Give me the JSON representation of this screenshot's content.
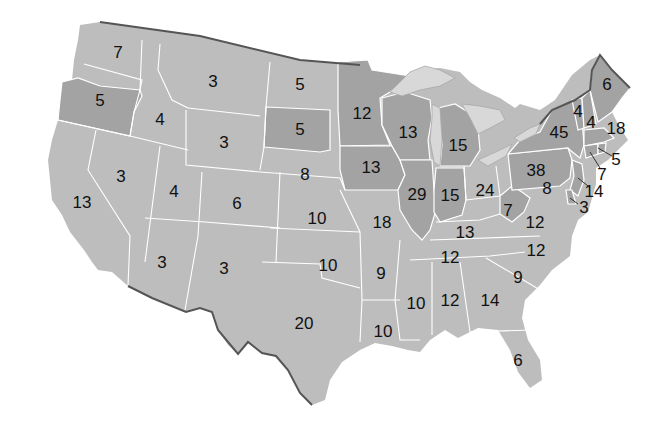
{
  "map": {
    "title": "",
    "type": "choropleth-electoral-votes",
    "colors": {
      "light": "#bdbdbd",
      "dark": "#a3a3a3",
      "border": "#555555",
      "background": "#ffffff"
    },
    "states": [
      {
        "abbr": "WA",
        "value": "7",
        "x": 118,
        "y": 52,
        "shade": "light"
      },
      {
        "abbr": "OR",
        "value": "5",
        "x": 100,
        "y": 100,
        "shade": "dark"
      },
      {
        "abbr": "CA",
        "value": "13",
        "x": 82,
        "y": 202,
        "shade": "light"
      },
      {
        "abbr": "NV",
        "value": "3",
        "x": 121,
        "y": 176,
        "shade": "light"
      },
      {
        "abbr": "ID",
        "value": "4",
        "x": 160,
        "y": 119,
        "shade": "light"
      },
      {
        "abbr": "MT",
        "value": "3",
        "x": 213,
        "y": 81,
        "shade": "light"
      },
      {
        "abbr": "WY",
        "value": "3",
        "x": 224,
        "y": 142,
        "shade": "light"
      },
      {
        "abbr": "UT",
        "value": "4",
        "x": 174,
        "y": 191,
        "shade": "light"
      },
      {
        "abbr": "AZ",
        "value": "3",
        "x": 162,
        "y": 262,
        "shade": "light"
      },
      {
        "abbr": "CO",
        "value": "6",
        "x": 237,
        "y": 203,
        "shade": "light"
      },
      {
        "abbr": "NM",
        "value": "3",
        "x": 224,
        "y": 268,
        "shade": "light"
      },
      {
        "abbr": "ND",
        "value": "5",
        "x": 300,
        "y": 84,
        "shade": "light"
      },
      {
        "abbr": "SD",
        "value": "5",
        "x": 300,
        "y": 129,
        "shade": "dark"
      },
      {
        "abbr": "NE",
        "value": "8",
        "x": 305,
        "y": 174,
        "shade": "light"
      },
      {
        "abbr": "KS",
        "value": "10",
        "x": 317,
        "y": 218,
        "shade": "light"
      },
      {
        "abbr": "OK",
        "value": "10",
        "x": 328,
        "y": 265,
        "shade": "light"
      },
      {
        "abbr": "TX",
        "value": "20",
        "x": 304,
        "y": 323,
        "shade": "light"
      },
      {
        "abbr": "MN",
        "value": "12",
        "x": 362,
        "y": 113,
        "shade": "dark"
      },
      {
        "abbr": "IA",
        "value": "13",
        "x": 371,
        "y": 167,
        "shade": "dark"
      },
      {
        "abbr": "MO",
        "value": "18",
        "x": 382,
        "y": 222,
        "shade": "light"
      },
      {
        "abbr": "AR",
        "value": "9",
        "x": 381,
        "y": 273,
        "shade": "light"
      },
      {
        "abbr": "LA",
        "value": "10",
        "x": 383,
        "y": 331,
        "shade": "light"
      },
      {
        "abbr": "WI",
        "value": "13",
        "x": 408,
        "y": 132,
        "shade": "dark"
      },
      {
        "abbr": "IL",
        "value": "29",
        "x": 417,
        "y": 194,
        "shade": "dark"
      },
      {
        "abbr": "MI",
        "value": "15",
        "x": 458,
        "y": 145,
        "shade": "dark"
      },
      {
        "abbr": "IN",
        "value": "15",
        "x": 450,
        "y": 195,
        "shade": "dark"
      },
      {
        "abbr": "OH",
        "value": "24",
        "x": 485,
        "y": 190,
        "shade": "light"
      },
      {
        "abbr": "KY",
        "value": "13",
        "x": 465,
        "y": 232,
        "shade": "light"
      },
      {
        "abbr": "TN",
        "value": "12",
        "x": 450,
        "y": 257,
        "shade": "light"
      },
      {
        "abbr": "MS",
        "value": "10",
        "x": 416,
        "y": 303,
        "shade": "light"
      },
      {
        "abbr": "AL",
        "value": "12",
        "x": 450,
        "y": 300,
        "shade": "light"
      },
      {
        "abbr": "GA",
        "value": "14",
        "x": 490,
        "y": 300,
        "shade": "light"
      },
      {
        "abbr": "FL",
        "value": "6",
        "x": 518,
        "y": 360,
        "shade": "light"
      },
      {
        "abbr": "SC",
        "value": "9",
        "x": 518,
        "y": 277,
        "shade": "light"
      },
      {
        "abbr": "NC",
        "value": "12",
        "x": 536,
        "y": 250,
        "shade": "light"
      },
      {
        "abbr": "VA",
        "value": "12",
        "x": 535,
        "y": 222,
        "shade": "light"
      },
      {
        "abbr": "WV",
        "value": "7",
        "x": 508,
        "y": 210,
        "shade": "dark"
      },
      {
        "abbr": "PA",
        "value": "38",
        "x": 536,
        "y": 170,
        "shade": "dark"
      },
      {
        "abbr": "NY",
        "value": "45",
        "x": 559,
        "y": 132,
        "shade": "dark"
      },
      {
        "abbr": "VT",
        "value": "4",
        "x": 578,
        "y": 111,
        "shade": "dark"
      },
      {
        "abbr": "NH",
        "value": "4",
        "x": 591,
        "y": 122,
        "shade": "dark"
      },
      {
        "abbr": "ME",
        "value": "6",
        "x": 607,
        "y": 84,
        "shade": "dark"
      },
      {
        "abbr": "MA",
        "value": "18",
        "x": 616,
        "y": 128,
        "shade": "dark"
      },
      {
        "abbr": "RI",
        "value": "5",
        "x": 616,
        "y": 159,
        "shade": "dark"
      },
      {
        "abbr": "CT",
        "value": "7",
        "x": 602,
        "y": 174,
        "shade": "dark"
      },
      {
        "abbr": "NJ",
        "value": "14",
        "x": 594,
        "y": 191,
        "shade": "dark"
      },
      {
        "abbr": "MD",
        "value": "8",
        "x": 547,
        "y": 188,
        "shade": "light"
      },
      {
        "abbr": "DE",
        "value": "3",
        "x": 584,
        "y": 207,
        "shade": "dark"
      }
    ]
  }
}
